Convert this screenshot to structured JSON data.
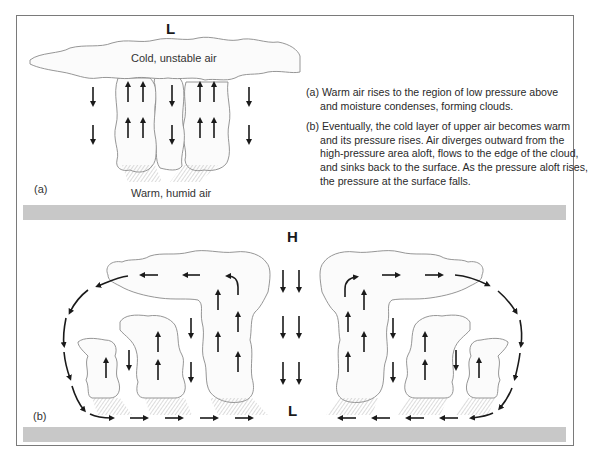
{
  "figure": {
    "panel_a": {
      "panel_label": "(a)",
      "pressure_top": "L",
      "top_air_label": "Cold, unstable air",
      "bottom_air_label": "Warm, humid air"
    },
    "panel_b": {
      "panel_label": "(b)",
      "pressure_top": "H",
      "pressure_bottom": "L"
    },
    "captions": [
      {
        "marker": "(a)",
        "text": "Warm air rises to the region of low pressure above and moisture condenses, forming clouds."
      },
      {
        "marker": "(b)",
        "text": "Eventually, the cold layer of upper air becomes warm and its pressure rises. Air diverges outward from the high-pressure area aloft, flows to the edge of the cloud, and sinks back to the surface. As the pressure aloft rises, the pressure at the surface falls."
      }
    ],
    "colors": {
      "frame": "#7a7a7a",
      "separator_bar": "#c8c8c8",
      "cloud_outline": "#8a8a8a",
      "arrows": "#1a1a1a"
    }
  },
  "caption_lines": {
    "a1": "(a) Warm air rises to the region of low pressure above",
    "a2": "and moisture condenses, forming clouds.",
    "b1": "(b) Eventually, the cold layer of upper air becomes warm",
    "b2": "and its pressure rises. Air diverges outward from the",
    "b3": "high-pressure area aloft, flows to the edge of the cloud,",
    "b4": "and sinks back to the surface. As the pressure aloft rises,",
    "b5": "the pressure at the surface falls."
  }
}
